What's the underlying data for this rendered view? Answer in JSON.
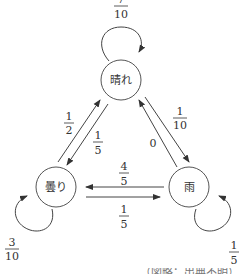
{
  "diagram": {
    "type": "markov-state-transition",
    "nodes": [
      {
        "id": "sunny",
        "label": "晴れ"
      },
      {
        "id": "cloudy",
        "label": "曇り"
      },
      {
        "id": "rain",
        "label": "雨"
      }
    ],
    "edges": [
      {
        "from": "sunny",
        "to": "sunny",
        "num": "7",
        "den": "10"
      },
      {
        "from": "sunny",
        "to": "cloudy",
        "num": "1",
        "den": "5"
      },
      {
        "from": "sunny",
        "to": "rain",
        "num": "1",
        "den": "10"
      },
      {
        "from": "cloudy",
        "to": "sunny",
        "num": "1",
        "den": "2"
      },
      {
        "from": "cloudy",
        "to": "cloudy",
        "num": "3",
        "den": "10"
      },
      {
        "from": "cloudy",
        "to": "rain",
        "num": "1",
        "den": "5"
      },
      {
        "from": "rain",
        "to": "sunny",
        "value": "0"
      },
      {
        "from": "rain",
        "to": "cloudy",
        "num": "4",
        "den": "5"
      },
      {
        "from": "rain",
        "to": "rain",
        "num": "1",
        "den": "5"
      }
    ],
    "footer_clipped": "（図略：出典不明）"
  }
}
